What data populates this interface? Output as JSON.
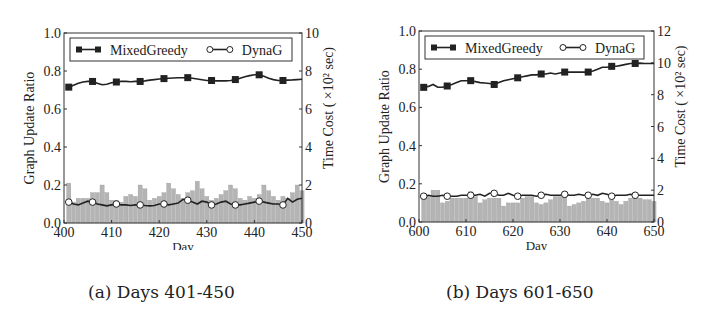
{
  "chart_data": [
    {
      "type": "bar+line",
      "caption": "(a) Days 401-450",
      "xlabel": "Day",
      "ylabel": "Graph Update Ratio",
      "y2label": "Time Cost ( ×10² sec)",
      "xlim": [
        400,
        450
      ],
      "xticks": [
        400,
        410,
        420,
        430,
        440,
        450
      ],
      "ylim": [
        0,
        1.0
      ],
      "yticks": [
        "0.0",
        "0.2",
        "0.4",
        "0.6",
        "0.8",
        "1.0"
      ],
      "y2lim": [
        0,
        10
      ],
      "y2ticks": [
        "0",
        "2",
        "4",
        "6",
        "8",
        "10"
      ],
      "legend": [
        "MixedGreedy",
        "DynaG"
      ],
      "legend_position": "top",
      "marker_days": [
        401,
        406,
        411,
        416,
        421,
        426,
        431,
        436,
        441,
        446
      ],
      "series": [
        {
          "name": "MixedGreedy",
          "marker": "filled-square",
          "values": [
            0.715,
            0.725,
            0.735,
            0.742,
            0.745,
            0.745,
            0.735,
            0.728,
            0.73,
            0.738,
            0.742,
            0.745,
            0.745,
            0.743,
            0.745,
            0.745,
            0.748,
            0.752,
            0.755,
            0.758,
            0.76,
            0.762,
            0.763,
            0.764,
            0.765,
            0.765,
            0.762,
            0.758,
            0.754,
            0.75,
            0.75,
            0.748,
            0.748,
            0.748,
            0.75,
            0.755,
            0.762,
            0.77,
            0.776,
            0.78,
            0.78,
            0.772,
            0.762,
            0.755,
            0.75,
            0.75,
            0.752,
            0.753,
            0.755,
            0.757
          ]
        },
        {
          "name": "DynaG",
          "marker": "open-circle",
          "values": [
            0.11,
            0.1,
            0.095,
            0.105,
            0.115,
            0.11,
            0.1,
            0.095,
            0.09,
            0.095,
            0.1,
            0.095,
            0.095,
            0.092,
            0.095,
            0.095,
            0.092,
            0.09,
            0.092,
            0.1,
            0.1,
            0.095,
            0.1,
            0.105,
            0.125,
            0.12,
            0.11,
            0.1,
            0.115,
            0.11,
            0.095,
            0.1,
            0.11,
            0.115,
            0.1,
            0.095,
            0.095,
            0.1,
            0.105,
            0.11,
            0.115,
            0.11,
            0.105,
            0.1,
            0.1,
            0.095,
            0.13,
            0.11,
            0.125,
            0.13
          ]
        },
        {
          "name": "Time Cost",
          "type": "bar",
          "axis": "right",
          "values": [
            2.1,
            1.1,
            1.3,
            1.3,
            1.3,
            1.6,
            1.6,
            2.0,
            1.6,
            1.2,
            1.2,
            1.1,
            1.4,
            1.5,
            1.4,
            2.0,
            1.8,
            1.2,
            1.3,
            1.4,
            1.6,
            2.1,
            1.8,
            1.5,
            1.3,
            1.6,
            1.7,
            2.2,
            1.8,
            1.4,
            1.2,
            1.3,
            1.5,
            1.7,
            2.0,
            1.8,
            1.3,
            1.2,
            1.4,
            1.3,
            1.5,
            2.0,
            1.7,
            1.4,
            1.2,
            1.4,
            1.3,
            1.6,
            2.0,
            1.7
          ]
        }
      ]
    },
    {
      "type": "bar+line",
      "caption": "(b) Days 601-650",
      "xlabel": "Day",
      "ylabel": "Graph Update Ratio",
      "y2label": "Time Cost ( ×10² sec)",
      "xlim": [
        600,
        650
      ],
      "xticks": [
        600,
        610,
        620,
        630,
        640,
        650
      ],
      "ylim": [
        0,
        1.0
      ],
      "yticks": [
        "0.0",
        "0.2",
        "0.4",
        "0.6",
        "0.8",
        "1.0"
      ],
      "y2lim": [
        0,
        12
      ],
      "y2ticks": [
        "0",
        "2",
        "4",
        "6",
        "8",
        "10",
        "12"
      ],
      "legend": [
        "MixedGreedy",
        "DynaG"
      ],
      "legend_position": "top",
      "marker_days": [
        601,
        606,
        611,
        616,
        621,
        626,
        631,
        636,
        641,
        646
      ],
      "series": [
        {
          "name": "MixedGreedy",
          "marker": "filled-square",
          "values": [
            0.705,
            0.71,
            0.72,
            0.705,
            0.705,
            0.712,
            0.72,
            0.73,
            0.74,
            0.74,
            0.74,
            0.735,
            0.73,
            0.728,
            0.725,
            0.72,
            0.73,
            0.74,
            0.745,
            0.75,
            0.755,
            0.76,
            0.765,
            0.77,
            0.77,
            0.775,
            0.775,
            0.78,
            0.775,
            0.78,
            0.785,
            0.785,
            0.785,
            0.785,
            0.785,
            0.785,
            0.79,
            0.8,
            0.81,
            0.81,
            0.815,
            0.815,
            0.82,
            0.825,
            0.83,
            0.83,
            0.832,
            0.83,
            0.83,
            0.83
          ]
        },
        {
          "name": "DynaG",
          "marker": "open-circle",
          "values": [
            0.135,
            0.14,
            0.135,
            0.135,
            0.14,
            0.135,
            0.135,
            0.135,
            0.14,
            0.14,
            0.14,
            0.14,
            0.145,
            0.135,
            0.15,
            0.15,
            0.14,
            0.14,
            0.15,
            0.14,
            0.135,
            0.14,
            0.14,
            0.14,
            0.135,
            0.14,
            0.145,
            0.14,
            0.14,
            0.14,
            0.145,
            0.14,
            0.14,
            0.145,
            0.14,
            0.14,
            0.145,
            0.14,
            0.15,
            0.145,
            0.135,
            0.14,
            0.14,
            0.14,
            0.145,
            0.14,
            0.14,
            0.14,
            0.14,
            0.14
          ]
        },
        {
          "name": "Time Cost",
          "type": "bar",
          "axis": "right",
          "values": [
            1.5,
            1.6,
            2.0,
            2.0,
            1.2,
            1.3,
            1.5,
            1.5,
            1.5,
            1.5,
            1.9,
            1.6,
            1.2,
            1.4,
            1.5,
            1.5,
            1.5,
            1.0,
            1.2,
            1.2,
            1.2,
            1.5,
            1.6,
            1.6,
            1.2,
            1.1,
            1.2,
            1.4,
            1.6,
            1.6,
            1.6,
            1.0,
            1.1,
            1.2,
            1.3,
            1.5,
            1.5,
            1.5,
            1.3,
            1.2,
            1.4,
            1.3,
            1.1,
            1.3,
            1.5,
            1.6,
            1.5,
            1.4,
            1.4,
            1.3
          ]
        }
      ]
    }
  ]
}
